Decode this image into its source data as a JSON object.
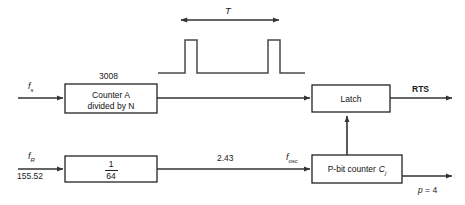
{
  "diagram": {
    "stroke_color": "#333333",
    "text_color": "#111111",
    "background": "#ffffff"
  },
  "waveform": {
    "period_label": "T",
    "pulse_count": 2,
    "description": "two narrow pulses on baseline"
  },
  "blocks": {
    "counter_a": {
      "line1": "Counter A",
      "line2": "divided by N",
      "top_label": "3008"
    },
    "divider": {
      "numerator": "1",
      "denominator": "64"
    },
    "latch": {
      "label": "Latch"
    },
    "p_bit_counter": {
      "label": "P-bit counter",
      "symbol": "C",
      "symbol_subscript": "j"
    }
  },
  "signals": {
    "input_top": {
      "symbol": "f",
      "subscript": "s"
    },
    "input_bottom": {
      "symbol": "f",
      "subscript": "R",
      "value": "155.52"
    },
    "mid_value": "2.43",
    "osc": {
      "symbol": "f",
      "subscript": "osc"
    },
    "output_top": "RTS",
    "output_bottom": "p = 4",
    "output_bottom_symbol": "p",
    "output_bottom_value": "4"
  }
}
